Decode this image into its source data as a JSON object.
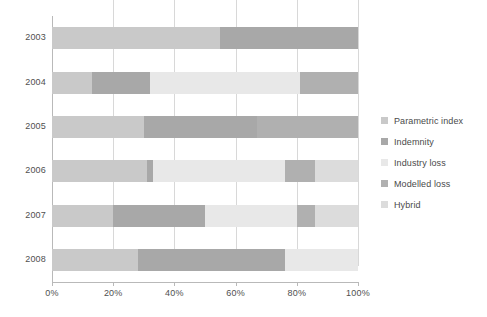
{
  "chart_data": {
    "type": "bar",
    "orientation": "horizontal",
    "stacked": true,
    "stack_mode": "percent",
    "title": "",
    "subtitle": "",
    "xlabel": "",
    "ylabel": "",
    "xlim": [
      0,
      100
    ],
    "xticks": [
      0,
      20,
      40,
      60,
      80,
      100
    ],
    "xtick_labels": [
      "0%",
      "20%",
      "40%",
      "60%",
      "80%",
      "100%"
    ],
    "grid": "vertical",
    "legend_position": "right",
    "categories": [
      "2003",
      "2004",
      "2005",
      "2006",
      "2007",
      "2008"
    ],
    "series": [
      {
        "name": "Parametric index",
        "color": "#c9c9c9",
        "values": [
          55,
          13,
          30,
          31,
          20,
          28
        ]
      },
      {
        "name": "Indemnity",
        "color": "#a8a8a8",
        "values": [
          45,
          19,
          37,
          2,
          30,
          48
        ]
      },
      {
        "name": "Industry loss",
        "color": "#e8e8e8",
        "values": [
          0,
          49,
          0,
          43,
          30,
          24
        ]
      },
      {
        "name": "Modelled loss",
        "color": "#b0b0b0",
        "values": [
          0,
          19,
          33,
          10,
          6,
          0
        ]
      },
      {
        "name": "Hybrid",
        "color": "#dcdcdc",
        "values": [
          0,
          0,
          0,
          14,
          14,
          0
        ]
      }
    ]
  },
  "legend": {
    "items": [
      {
        "label": "Parametric index"
      },
      {
        "label": "Indemnity"
      },
      {
        "label": "Industry loss"
      },
      {
        "label": "Modelled loss"
      },
      {
        "label": "Hybrid"
      }
    ]
  },
  "axes": {
    "y_tick_labels": [
      "2003",
      "2004",
      "2005",
      "2006",
      "2007",
      "2008"
    ],
    "x_tick_labels": [
      "0%",
      "20%",
      "40%",
      "60%",
      "80%",
      "100%"
    ]
  },
  "colors": {
    "axis": "#b9b9b9",
    "grid": "#d8d8d8",
    "text": "#4a4a4a",
    "background": "#ffffff"
  }
}
